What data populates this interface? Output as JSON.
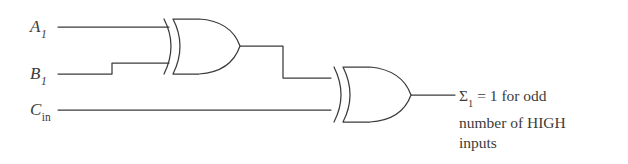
{
  "figure": {
    "type": "logic-circuit-diagram",
    "background_color": "#ffffff",
    "line_color": "#3b3b3b",
    "text_color": "#3b3b3b"
  },
  "inputs": [
    {
      "id": "a1",
      "base": "A",
      "subscript": "1",
      "subscript_italic": true,
      "wire_y": 27
    },
    {
      "id": "b1",
      "base": "B",
      "subscript": "1",
      "subscript_italic": true,
      "wire_y": 74
    },
    {
      "id": "cin",
      "base": "C",
      "subscript": "in",
      "subscript_italic": false,
      "wire_y": 110
    }
  ],
  "gates": [
    {
      "id": "xor-1",
      "type": "XOR",
      "inputs": [
        "A1",
        "B1"
      ],
      "output": "xor1-out"
    },
    {
      "id": "xor-2",
      "type": "XOR",
      "inputs": [
        "xor1-out",
        "Cin"
      ],
      "output": "Sigma1"
    }
  ],
  "output": {
    "symbol": "Σ",
    "subscript": "1",
    "lines": [
      "Σ₁ = 1 for odd",
      "number of HIGH",
      "inputs"
    ],
    "line1_prefix": "Σ",
    "line1_sub": "1",
    "line1_rest": " = 1 for odd",
    "line2": "number of HIGH",
    "line3": "inputs"
  }
}
